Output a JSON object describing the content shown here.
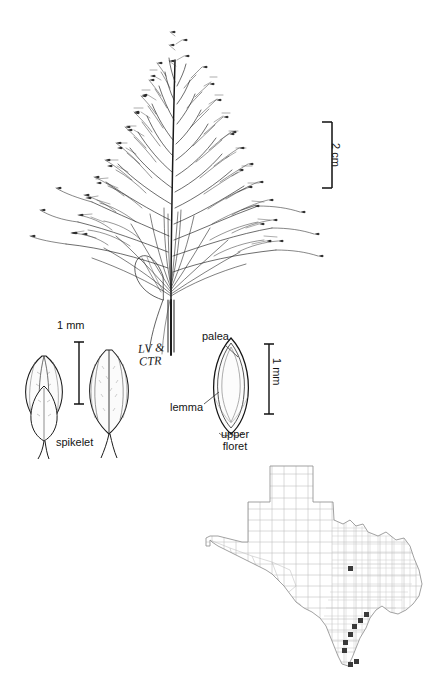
{
  "figure": {
    "type": "botanical-illustration-plate",
    "background_color": "#ffffff",
    "ink_color": "#1a1a1a",
    "map_line_color": "#bbbbbb",
    "map_outline_color": "#8a8a8a",
    "map_marker_color": "#333333"
  },
  "panicle": {
    "name": "inflorescence-panicle",
    "description": "open diffuse panicle with fine spreading branches and small spikelets",
    "scale_bar": {
      "label": "2 cm",
      "orientation": "vertical",
      "text_rotation_deg": 90
    }
  },
  "spikelet_figure": {
    "scale_bar": {
      "label": "1 mm",
      "orientation": "vertical",
      "text_rotation_deg": 0
    },
    "caption": "spikelet",
    "views": [
      "dorsal view",
      "ventral view"
    ]
  },
  "floret_figure": {
    "scale_bar": {
      "label": "1 mm",
      "orientation": "vertical",
      "text_rotation_deg": 90
    },
    "caption_line1": "upper",
    "caption_line2": "floret",
    "labels": [
      {
        "text": "palea",
        "leader": "down-right"
      },
      {
        "text": "lemma",
        "leader": "up-right"
      }
    ]
  },
  "artist_monogram": {
    "line1": "LV &",
    "line2": "CTR"
  },
  "map": {
    "name": "texas-county-distribution-map",
    "state": "Texas",
    "shows": "county boundaries with shaded counties indicating species distribution",
    "marker_count": 9
  }
}
